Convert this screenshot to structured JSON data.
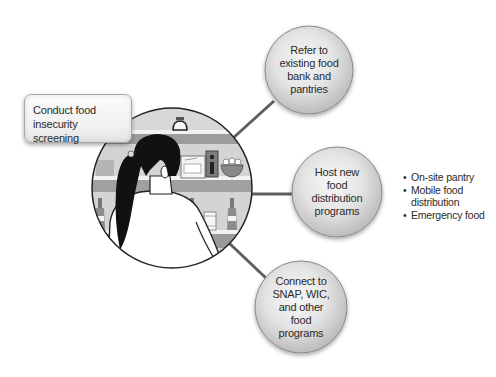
{
  "diagram": {
    "type": "hub-and-spoke",
    "hub": {
      "label": "Conduct food insecurity screening",
      "illustration": "woman-at-pantry-shelves"
    },
    "spokes": [
      {
        "id": "refer",
        "label": "Refer to\nexisting food\nbank and\npantries"
      },
      {
        "id": "host",
        "label": "Host new\nfood\ndistribution\nprograms",
        "details": [
          "On-site pantry",
          "Mobile food distribution",
          "Emergency food"
        ]
      },
      {
        "id": "connect",
        "label": "Connect to\nSNAP, WIC,\nand other\nfood\nprograms"
      }
    ]
  },
  "colors": {
    "background": "#ffffff",
    "bubble_fill_light": "#f4f4f4",
    "bubble_fill_dark": "#bdbdbd",
    "bubble_border": "#8a8a8a",
    "connector": "#5f5f5f",
    "shelf": "#9a9a9a",
    "shelf_back": "#cfcfcf",
    "hair": "#111111",
    "text": "#2b2b2b"
  }
}
